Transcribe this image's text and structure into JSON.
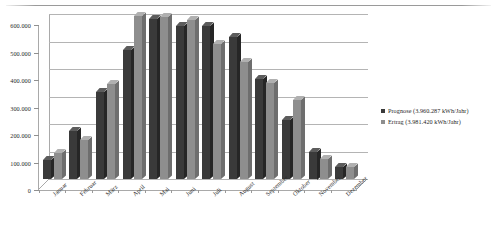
{
  "chart_data": {
    "type": "bar",
    "title": "",
    "subtitle": "",
    "xlabel": "",
    "ylabel": "",
    "ylim": [
      0,
      600000
    ],
    "ytick_labels": [
      "600.000",
      "500.000",
      "400.000",
      "300.000",
      "200.000",
      "100.000",
      "0"
    ],
    "ytick_values": [
      600000,
      500000,
      400000,
      300000,
      200000,
      100000,
      0
    ],
    "grid": true,
    "legend_position": "right",
    "categories": [
      "Januar",
      "Februar",
      "März",
      "April",
      "Mai",
      "Juni",
      "Juli",
      "August",
      "September",
      "Oktober",
      "November",
      "Dezember"
    ],
    "series": [
      {
        "name": "Prognose",
        "legend_label": "Prognose (3.960.287 kWh/Jahr)",
        "total": "3.960.287 kWh/Jahr",
        "color": "#3a3a3a",
        "values": [
          68000,
          175000,
          318000,
          470000,
          583000,
          556000,
          555000,
          518000,
          362000,
          214000,
          100000,
          45000
        ]
      },
      {
        "name": "Ertrag",
        "legend_label": "Ertrag (3.981.420 kWh/Jahr)",
        "total": "3.981.420 kWh/Jahr",
        "color": "#8e8e8e",
        "values": [
          95000,
          143000,
          345000,
          592000,
          588000,
          577000,
          490000,
          425000,
          350000,
          288000,
          72000,
          42000
        ]
      }
    ]
  },
  "legend": {
    "items": [
      {
        "label": "Prognose (3.960.287 kWh/Jahr)",
        "color": "#3a3a3a"
      },
      {
        "label": "Ertrag (3.981.420 kWh/Jahr)",
        "color": "#8e8e8e"
      }
    ]
  }
}
